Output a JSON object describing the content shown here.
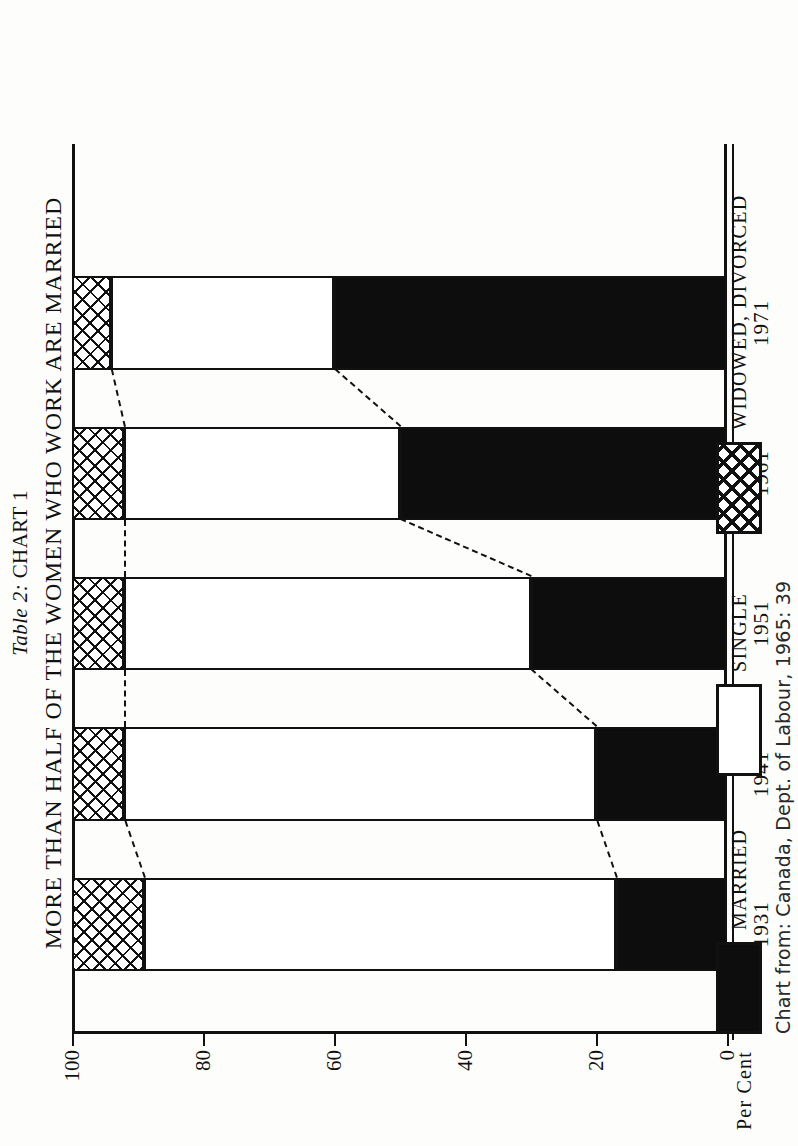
{
  "titles": {
    "table_label": "Table 2:",
    "chart_label": "CHART 1",
    "main": "MORE THAN HALF OF THE WOMEN WHO WORK ARE MARRIED"
  },
  "axis": {
    "y_title": "Per Cent",
    "y_ticks": [
      "0",
      "20",
      "40",
      "60",
      "80",
      "100"
    ]
  },
  "legend": {
    "married": "MARRIED",
    "single": "SINGLE",
    "widowed": "WIDOWED, DIVORCED"
  },
  "source": "Chart from: Canada, Dept. of Labour, 1965: 39",
  "colors": {
    "ink": "#111111",
    "married_fill": "#0d0d0d",
    "single_fill": "#ffffff",
    "paper": "#fdfdfb"
  },
  "chart_data": {
    "type": "bar",
    "title": "MORE THAN HALF OF THE WOMEN WHO WORK ARE MARRIED",
    "subtitle": "Table 2: CHART 1",
    "stacked": true,
    "orientation": "vertical",
    "xlabel": "",
    "ylabel": "Per Cent",
    "ylim": [
      0,
      100
    ],
    "yticks": [
      0,
      20,
      40,
      60,
      80,
      100
    ],
    "grid": false,
    "legend_position": "bottom",
    "categories": [
      "1931",
      "1941",
      "1951",
      "1961",
      "1971"
    ],
    "series": [
      {
        "name": "MARRIED",
        "values": [
          17,
          20,
          30,
          50,
          60
        ]
      },
      {
        "name": "SINGLE",
        "values": [
          72,
          72,
          62,
          42,
          34
        ]
      },
      {
        "name": "WIDOWED, DIVORCED",
        "values": [
          11,
          8,
          8,
          8,
          6
        ]
      }
    ],
    "cumulative_tops": {
      "married": [
        17,
        20,
        30,
        50,
        60
      ],
      "single": [
        89,
        92,
        92,
        92,
        94
      ]
    },
    "annotations": [
      "dashed connector lines join segment tops across bars"
    ],
    "source": "Chart from: Canada, Dept. of Labour, 1965: 39"
  }
}
